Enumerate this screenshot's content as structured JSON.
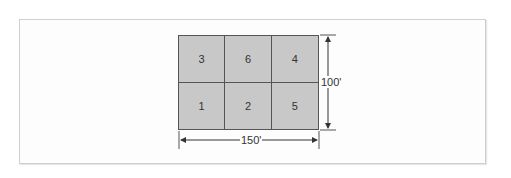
{
  "diagram": {
    "parcels": [
      {
        "label": "3",
        "row": 1,
        "col": 1
      },
      {
        "label": "6",
        "row": 1,
        "col": 2
      },
      {
        "label": "4",
        "row": 1,
        "col": 3
      },
      {
        "label": "1",
        "row": 2,
        "col": 1
      },
      {
        "label": "2",
        "row": 2,
        "col": 2
      },
      {
        "label": "5",
        "row": 2,
        "col": 3
      }
    ],
    "dimensions": {
      "width": "150'",
      "height": "100'"
    },
    "colors": {
      "parcel_fill": "#c8c8c8",
      "line": "#555555",
      "frame": "#cfcfcf"
    }
  }
}
